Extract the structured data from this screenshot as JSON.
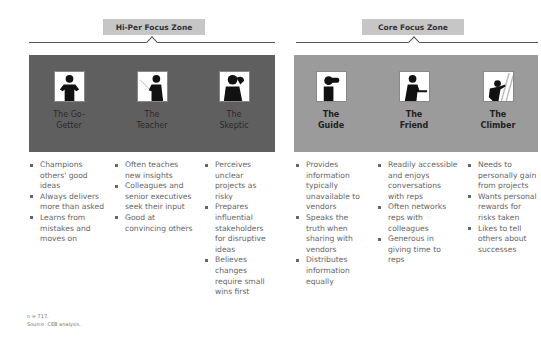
{
  "zones": [
    {
      "label": "Hi-Per Focus Zone",
      "panel_color": "#5f5f5f",
      "personas": [
        {
          "name_line1": "The Go-",
          "name_line2": "Getter",
          "icon": "hands-on-hips-person-icon",
          "traits": [
            "Champions others' good ideas",
            "Always delivers more than asked",
            "Learns from mistakes and moves on"
          ]
        },
        {
          "name_line1": "The",
          "name_line2": "Teacher",
          "icon": "pointer-teaching-person-icon",
          "traits": [
            "Often teaches new insights",
            "Colleagues and senior executives seek their input",
            "Good at convincing others"
          ]
        },
        {
          "name_line1": "The",
          "name_line2": "Skeptic",
          "icon": "head-scratching-person-icon",
          "traits": [
            "Perceives unclear projects as risky",
            "Prepares influential stakeholders for disruptive ideas",
            "Believes changes require small wins first"
          ]
        }
      ]
    },
    {
      "label": "Core Focus Zone",
      "panel_color": "#9b9b9b",
      "personas": [
        {
          "name_line1": "The",
          "name_line2": "Guide",
          "icon": "binoculars-person-icon",
          "traits": [
            "Provides information typically unavailable to vendors",
            "Speaks the truth when sharing with vendors",
            "Distributes information equally"
          ]
        },
        {
          "name_line1": "The",
          "name_line2": "Friend",
          "icon": "handshake-person-icon",
          "traits": [
            "Readily accessible and enjoys conversations with reps",
            "Often networks reps with colleagues",
            "Generous in giving time to reps"
          ]
        },
        {
          "name_line1": "The",
          "name_line2": "Climber",
          "icon": "ladder-climbing-person-icon",
          "traits": [
            "Needs to personally gain from projects",
            "Wants personal rewards for risks taken",
            "Likes to tell others about successes"
          ]
        }
      ]
    }
  ],
  "footnote": {
    "n": "n = 717.",
    "source": "Source: CEB analysis."
  }
}
